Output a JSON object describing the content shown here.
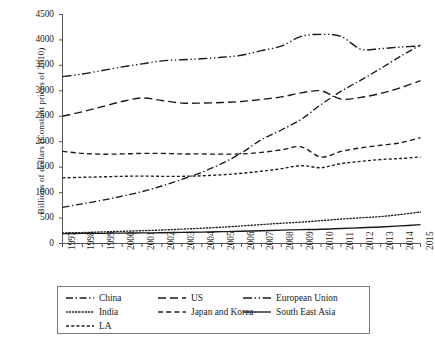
{
  "chart_data": {
    "type": "line",
    "title": "",
    "xlabel": "",
    "ylabel": "Billions of dollars (Constant prices of 2010)",
    "x": [
      1997,
      1998,
      1999,
      2000,
      2001,
      2002,
      2003,
      2004,
      2005,
      2006,
      2007,
      2008,
      2009,
      2010,
      2011,
      2012,
      2013,
      2014,
      2015
    ],
    "xtick_labels": [
      "1997",
      "1998",
      "1999",
      "2000",
      "2001",
      "2002",
      "2003",
      "2004",
      "2005",
      "2006",
      "2007",
      "2008",
      "2009",
      "2010",
      "2011",
      "2012",
      "2013",
      "2014",
      "2015"
    ],
    "ytick_labels": [
      "0",
      "500",
      "1000",
      "1500",
      "2000",
      "2500",
      "3000",
      "3500",
      "4000",
      "4500"
    ],
    "ytick_values": [
      0,
      500,
      1000,
      1500,
      2000,
      2500,
      3000,
      3500,
      4000,
      4500
    ],
    "ylim": [
      0,
      4500
    ],
    "xlim": [
      1997,
      2015
    ],
    "grid": false,
    "legend_position": "below-axes",
    "series": [
      {
        "name": "China",
        "line_style": "dash-dot",
        "color": "#1a1a1a",
        "values": [
          710,
          780,
          850,
          930,
          1020,
          1130,
          1260,
          1400,
          1570,
          1780,
          2040,
          2230,
          2440,
          2730,
          2990,
          3210,
          3440,
          3680,
          3900
        ]
      },
      {
        "name": "US",
        "line_style": "long-dash",
        "color": "#1a1a1a",
        "values": [
          2500,
          2590,
          2690,
          2790,
          2860,
          2810,
          2760,
          2760,
          2770,
          2790,
          2830,
          2880,
          2960,
          3000,
          2840,
          2870,
          2950,
          3060,
          3200
        ]
      },
      {
        "name": "European Union",
        "line_style": "dash-dot-dot",
        "color": "#1a1a1a",
        "values": [
          3280,
          3330,
          3400,
          3470,
          3530,
          3590,
          3610,
          3630,
          3660,
          3700,
          3790,
          3880,
          4070,
          4110,
          4070,
          3820,
          3830,
          3860,
          3880
        ]
      },
      {
        "name": "India",
        "line_style": "dotted",
        "color": "#1a1a1a",
        "values": [
          205,
          215,
          228,
          240,
          252,
          265,
          282,
          300,
          320,
          345,
          372,
          398,
          420,
          450,
          480,
          505,
          530,
          570,
          620
        ]
      },
      {
        "name": "Japan and Korea",
        "line_style": "dashed",
        "color": "#1a1a1a",
        "values": [
          1810,
          1770,
          1755,
          1760,
          1770,
          1770,
          1760,
          1760,
          1755,
          1760,
          1790,
          1840,
          1900,
          1700,
          1810,
          1880,
          1930,
          1980,
          2080
        ]
      },
      {
        "name": "South East Asia",
        "line_style": "solid",
        "color": "#1a1a1a",
        "values": [
          195,
          198,
          200,
          205,
          208,
          212,
          218,
          224,
          232,
          240,
          250,
          262,
          272,
          280,
          295,
          310,
          325,
          345,
          370
        ]
      },
      {
        "name": "LA",
        "line_style": "short-dash",
        "color": "#1a1a1a",
        "values": [
          1290,
          1300,
          1310,
          1320,
          1325,
          1320,
          1320,
          1330,
          1350,
          1380,
          1420,
          1470,
          1530,
          1490,
          1570,
          1615,
          1650,
          1670,
          1700
        ]
      }
    ]
  },
  "legend": {
    "rows": [
      [
        {
          "label": "China",
          "style": "dash-dot"
        },
        {
          "label": "US",
          "style": "long-dash"
        },
        {
          "label": "European Union",
          "style": "dash-dot-dot"
        }
      ],
      [
        {
          "label": "India",
          "style": "dotted"
        },
        {
          "label": "Japan and Korea",
          "style": "dashed"
        },
        {
          "label": "South East Asia",
          "style": "solid"
        }
      ],
      [
        {
          "label": "LA",
          "style": "short-dash"
        }
      ]
    ]
  }
}
